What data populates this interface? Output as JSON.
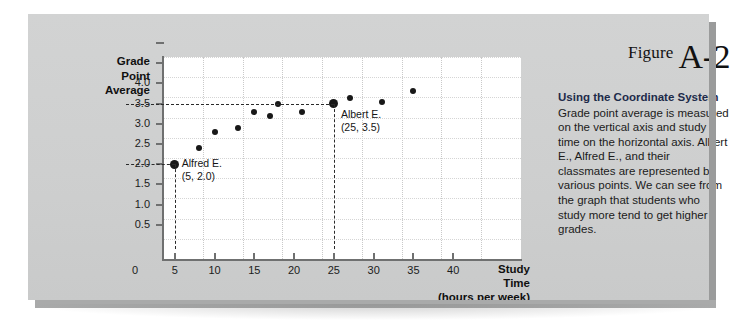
{
  "panel": {
    "background_color": "#cfd0d0",
    "edge_color": "#9a9b9b"
  },
  "figure": {
    "label_word": "Figure",
    "number": "A-2",
    "caption_title": "Using the Coordinate System",
    "caption_body": "Grade point average is measured on the vertical axis and study time on the horizontal axis. Albert E., Alfred E., and their classmates are represented by various points. We can see from the graph that students who study more tend to get higher grades."
  },
  "chart_data": {
    "type": "scatter",
    "title": "",
    "xlabel": "Study Time (hours per week)",
    "ylabel": "Grade Point Average",
    "xlabel_lines": [
      "Study",
      "Time",
      "(hours per week)"
    ],
    "ylabel_lines": [
      "Grade",
      "Point",
      "Average"
    ],
    "xlim": [
      0,
      45
    ],
    "ylim": [
      0,
      5.0
    ],
    "xticks": [
      0,
      5,
      10,
      15,
      20,
      25,
      30,
      35,
      40
    ],
    "xtick_labels": [
      "0",
      "5",
      "10",
      "15",
      "20",
      "25",
      "30",
      "35",
      "40"
    ],
    "yticks": [
      0.5,
      1.0,
      1.5,
      2.0,
      2.5,
      3.0,
      3.5,
      4.0,
      4.5,
      5.0
    ],
    "ytick_labels": [
      "0.5",
      "1.0",
      "1.5",
      "2.0",
      "2.5",
      "3.0",
      "3.5",
      "4.0",
      "",
      ""
    ],
    "grid": true,
    "legend": "none",
    "point_color": "#181818",
    "points": [
      {
        "x": 5,
        "y": 2.0,
        "highlight": true,
        "label": "Alfred E."
      },
      {
        "x": 8,
        "y": 2.4,
        "highlight": false,
        "label": ""
      },
      {
        "x": 10,
        "y": 2.8,
        "highlight": false,
        "label": ""
      },
      {
        "x": 13,
        "y": 2.9,
        "highlight": false,
        "label": ""
      },
      {
        "x": 15,
        "y": 3.3,
        "highlight": false,
        "label": ""
      },
      {
        "x": 17,
        "y": 3.2,
        "highlight": false,
        "label": ""
      },
      {
        "x": 18,
        "y": 3.5,
        "highlight": false,
        "label": ""
      },
      {
        "x": 21,
        "y": 3.3,
        "highlight": false,
        "label": ""
      },
      {
        "x": 25,
        "y": 3.5,
        "highlight": true,
        "label": "Albert E."
      },
      {
        "x": 27,
        "y": 3.65,
        "highlight": false,
        "label": ""
      },
      {
        "x": 31,
        "y": 3.55,
        "highlight": false,
        "label": ""
      },
      {
        "x": 35,
        "y": 3.8,
        "highlight": false,
        "label": ""
      }
    ],
    "annotations": [
      {
        "name": "alfred",
        "title": "Alfred E.",
        "coords": "(5, 2.0)"
      },
      {
        "name": "albert",
        "title": "Albert E.",
        "coords": "(25, 3.5)"
      }
    ]
  }
}
